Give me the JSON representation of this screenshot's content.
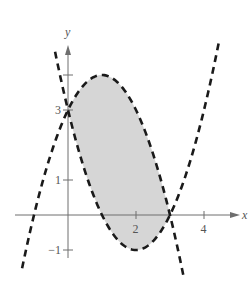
{
  "chart_data": {
    "type": "line",
    "title": "",
    "xlabel": "x",
    "ylabel": "y",
    "xlim": [
      -1.5,
      5.1
    ],
    "ylim": [
      -1.3,
      5.0
    ],
    "grid": false,
    "legend": null,
    "x_ticks": [
      {
        "value": 2,
        "label": "2"
      },
      {
        "value": 4,
        "label": "4"
      }
    ],
    "y_ticks": [
      {
        "value": -1,
        "label": "−1"
      },
      {
        "value": 1,
        "label": "1"
      },
      {
        "value": 3,
        "label": "3"
      },
      {
        "value": 4,
        "label": ""
      }
    ],
    "series": [
      {
        "name": "y = x^2 - 4x + 3",
        "style": "dashed",
        "coefficients": [
          1,
          -4,
          3
        ],
        "x_range": [
          -0.38,
          3.35
        ],
        "x": [
          -0.38,
          0,
          0.5,
          1,
          1.5,
          2,
          2.5,
          3,
          3.35
        ],
        "values": [
          4.66,
          3,
          1.25,
          0,
          -0.75,
          -1,
          -0.75,
          0,
          1.0
        ]
      },
      {
        "name": "y = x^2 - 4x + 3 (right)",
        "style": "dashed",
        "coefficients": [
          1,
          -4,
          3
        ],
        "x_range": [
          3.35,
          4.45
        ],
        "x": [
          3.35,
          4,
          4.45
        ],
        "values": [
          1.0,
          3,
          4.9
        ]
      },
      {
        "name": "y = -x^2 + 2x + 3",
        "style": "dashed",
        "coefficients": [
          -1,
          2,
          3
        ],
        "x_range": [
          -1.35,
          3.4
        ],
        "x": [
          -1.35,
          -1,
          0,
          1,
          2,
          3,
          3.4
        ],
        "values": [
          -1.52,
          0,
          3,
          4,
          3,
          0,
          -1.76
        ]
      }
    ],
    "shaded_region": {
      "between": [
        "y = -x^2 + 2x + 3",
        "y = x^2 - 4x + 3"
      ],
      "x_range": [
        0,
        3
      ],
      "intersection_points": [
        [
          0,
          3
        ],
        [
          3,
          0
        ]
      ],
      "fill": "#d6d6d6"
    },
    "colors": {
      "curve": "#1a1a1a",
      "axis": "#6e6e6e",
      "fill": "#d6d6d6"
    }
  }
}
